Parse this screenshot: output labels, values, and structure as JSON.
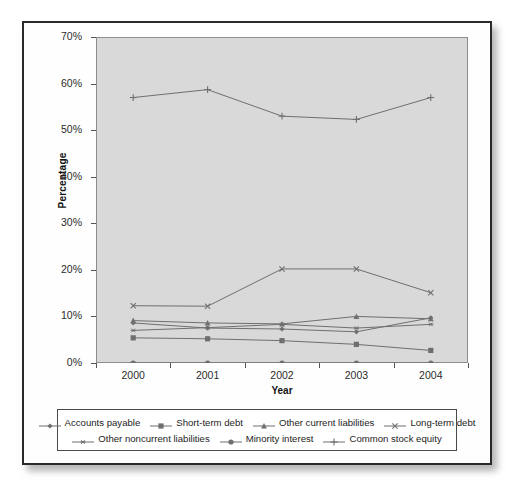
{
  "chart_data": {
    "type": "line",
    "title": "",
    "xlabel": "Year",
    "ylabel": "Percentage",
    "categories": [
      "2000",
      "2001",
      "2002",
      "2003",
      "2004"
    ],
    "x": [
      2000,
      2001,
      2002,
      2003,
      2004
    ],
    "ylim": [
      0,
      70
    ],
    "ytick_labels": [
      "0%",
      "10%",
      "20%",
      "30%",
      "40%",
      "50%",
      "60%",
      "70%"
    ],
    "ytick_values": [
      0,
      10,
      20,
      30,
      40,
      50,
      60,
      70
    ],
    "grid": false,
    "legend_position": "bottom",
    "plot_background": "#d9d9d9",
    "line_color": "#6f6f6f",
    "series": [
      {
        "name": "Accounts payable",
        "marker": "diamond",
        "values": [
          8.6,
          7.5,
          7.3,
          6.7,
          9.7
        ]
      },
      {
        "name": "Short-term debt",
        "marker": "square",
        "values": [
          5.4,
          5.2,
          4.8,
          4.0,
          2.7
        ]
      },
      {
        "name": "Other current liabilities",
        "marker": "triangle",
        "values": [
          9.1,
          8.6,
          8.4,
          10.0,
          9.5
        ]
      },
      {
        "name": "Long-term debt",
        "marker": "cross-x",
        "values": [
          12.3,
          12.2,
          20.2,
          20.2,
          15.1
        ]
      },
      {
        "name": "Other noncurrent liabilities",
        "marker": "asterisk",
        "values": [
          7.0,
          7.6,
          8.3,
          7.5,
          8.3
        ]
      },
      {
        "name": "Minority interest",
        "marker": "circle",
        "values": [
          0.0,
          0.0,
          0.0,
          0.0,
          0.0
        ]
      },
      {
        "name": "Common stock equity",
        "marker": "plus",
        "values": [
          57.0,
          58.7,
          53.0,
          52.3,
          57.0
        ]
      }
    ]
  },
  "axes": {
    "y_title": "Percentage",
    "x_title": "Year"
  },
  "legend": {
    "rows": [
      [
        {
          "label": "Accounts payable",
          "marker": "diamond"
        },
        {
          "label": "Short-term debt",
          "marker": "square"
        },
        {
          "label": "Other current liabilities",
          "marker": "triangle"
        },
        {
          "label": "Long-term debt",
          "marker": "cross-x"
        }
      ],
      [
        {
          "label": "Other noncurrent liabilities",
          "marker": "asterisk"
        },
        {
          "label": "Minority interest",
          "marker": "circle"
        },
        {
          "label": "Common stock equity",
          "marker": "plus"
        }
      ]
    ]
  }
}
